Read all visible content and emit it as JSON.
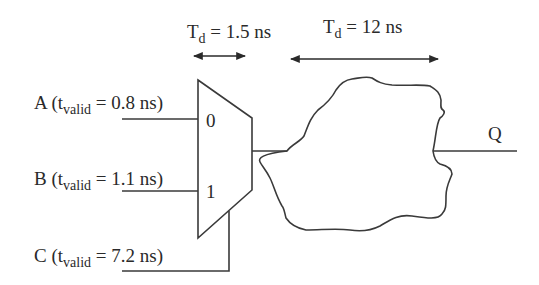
{
  "delays": {
    "mux": {
      "symbol": "T",
      "subscript": "d",
      "text": " = 1.5 ns"
    },
    "logic": {
      "symbol": "T",
      "subscript": "d",
      "text": " = 12 ns"
    }
  },
  "inputs": [
    {
      "name": "A",
      "prefix": "A (t",
      "subscript": "valid",
      "suffix": " = 0.8 ns)",
      "mux_port": "0"
    },
    {
      "name": "B",
      "prefix": "B (t",
      "subscript": "valid",
      "suffix": " = 1.1 ns)",
      "mux_port": "1"
    },
    {
      "name": "C",
      "prefix": "C (t",
      "subscript": "valid",
      "suffix": " = 7.2 ns)",
      "role": "select"
    }
  ],
  "mux": {
    "port0_label": "0",
    "port1_label": "1"
  },
  "output": {
    "label": "Q"
  },
  "colors": {
    "line": "#3a3a3a",
    "text": "#2a2a2a",
    "background": "#ffffff"
  }
}
